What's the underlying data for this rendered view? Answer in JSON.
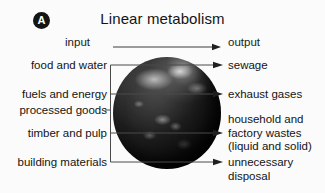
{
  "figure": {
    "panel_label": "A",
    "title": "Linear metabolism"
  },
  "top_row": {
    "input_label": "input",
    "output_label": "output",
    "arrow_icon": "arrow-right-icon"
  },
  "inputs": [
    {
      "label": "food and water"
    },
    {
      "label": "fuels and energy"
    },
    {
      "label": "processed goods"
    },
    {
      "label": "timber and pulp"
    },
    {
      "label": "building materials"
    }
  ],
  "outputs": [
    {
      "lines": [
        "sewage"
      ]
    },
    {
      "lines": [
        "exhaust gases"
      ]
    },
    {
      "lines": [
        "household and",
        "factory wastes",
        "(liquid and solid)"
      ]
    },
    {
      "lines": [
        "unnecessary",
        "disposal"
      ]
    }
  ],
  "center_graphic": {
    "name": "earth-globe",
    "description": "Earth globe"
  },
  "colors": {
    "background": "#fbfbfb",
    "text": "#141414",
    "line": "#3c3c3c",
    "badge_fill": "#141414",
    "badge_text": "#ffffff"
  }
}
